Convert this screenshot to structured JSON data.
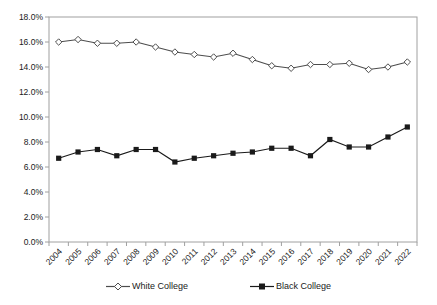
{
  "chart_data": {
    "type": "line",
    "title": "",
    "xlabel": "",
    "ylabel": "",
    "x": [
      2004,
      2005,
      2006,
      2007,
      2008,
      2009,
      2010,
      2011,
      2012,
      2013,
      2014,
      2015,
      2016,
      2017,
      2018,
      2019,
      2020,
      2021,
      2022
    ],
    "x_tick_labels": [
      "2004",
      "2005",
      "2006",
      "2007",
      "2008",
      "2009",
      "2010",
      "2011",
      "2012",
      "2013",
      "2014",
      "2015",
      "2016",
      "2017",
      "2018",
      "2019",
      "2020",
      "2021",
      "2022"
    ],
    "series": [
      {
        "name": "White College",
        "marker": "diamond-open",
        "color": "#4d4d4d",
        "marker_fill": "#ffffff",
        "values": [
          16.0,
          16.2,
          15.9,
          15.9,
          16.0,
          15.6,
          15.2,
          15.0,
          14.8,
          15.1,
          14.6,
          14.1,
          13.9,
          14.2,
          14.2,
          14.3,
          13.8,
          14.0,
          14.4
        ]
      },
      {
        "name": "Black College",
        "marker": "square-filled",
        "color": "#1a1a1a",
        "marker_fill": "#1a1a1a",
        "values": [
          6.7,
          7.2,
          7.4,
          6.9,
          7.4,
          7.4,
          6.4,
          6.7,
          6.9,
          7.1,
          7.2,
          7.5,
          7.5,
          6.9,
          8.2,
          7.6,
          7.6,
          8.4,
          9.2
        ]
      }
    ],
    "ylim": [
      0,
      18
    ],
    "ytick_step": 2,
    "y_tick_labels": [
      "0.0%",
      "2.0%",
      "4.0%",
      "6.0%",
      "8.0%",
      "10.0%",
      "12.0%",
      "14.0%",
      "16.0%",
      "18.0%"
    ],
    "grid": "none",
    "legend_position": "bottom-center",
    "axis_color": "#a0a0a0"
  }
}
